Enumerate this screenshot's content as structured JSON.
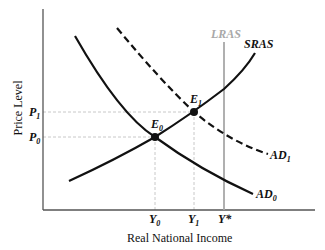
{
  "diagram": {
    "axes": {
      "y_label": "Price Level",
      "x_label": "Real National Income"
    },
    "price_ticks": [
      {
        "label": "P",
        "sub": "1",
        "y": 112
      },
      {
        "label": "P",
        "sub": "0",
        "y": 137
      }
    ],
    "income_ticks": [
      {
        "label": "Y",
        "sub": "0",
        "x": 155
      },
      {
        "label": "Y",
        "sub": "1",
        "x": 194
      },
      {
        "label": "Y*",
        "sub": "",
        "x": 224
      }
    ],
    "curves": {
      "lras": {
        "label": "LRAS",
        "color": "#a8a8a8"
      },
      "sras": {
        "label": "SRAS",
        "color": "#111111"
      },
      "ad0": {
        "label": "AD",
        "sub": "0",
        "style": "solid",
        "color": "#111111"
      },
      "ad1": {
        "label": "AD",
        "sub": "1",
        "style": "dashed",
        "color": "#111111"
      }
    },
    "equilibria": [
      {
        "label": "E",
        "sub": "0",
        "x": 155,
        "y": 137
      },
      {
        "label": "E",
        "sub": "1",
        "x": 194,
        "y": 112
      }
    ]
  }
}
